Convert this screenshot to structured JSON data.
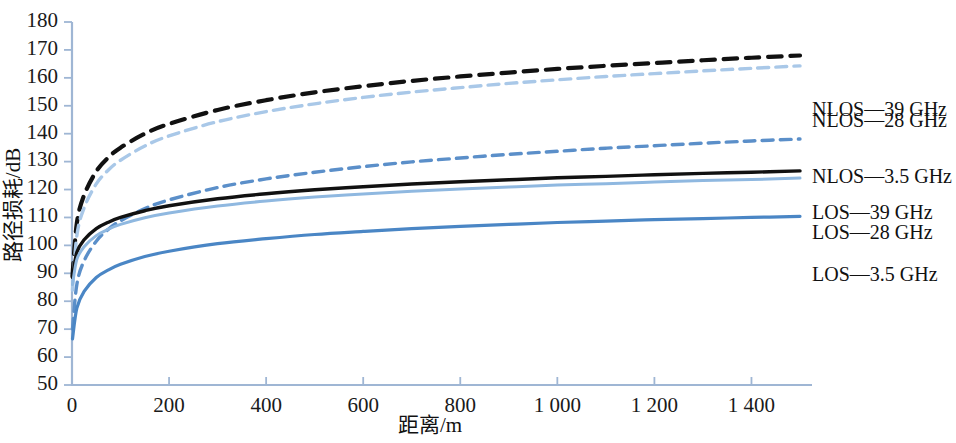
{
  "chart_data": {
    "type": "line",
    "title": "",
    "xlabel": "距离/m",
    "ylabel": "路径损耗/dB",
    "xlim": [
      0,
      1500
    ],
    "ylim": [
      50,
      180
    ],
    "xticks": [
      "0",
      "200",
      "400",
      "600",
      "800",
      "1 000",
      "1 200",
      "1 400"
    ],
    "xtick_values": [
      0,
      200,
      400,
      600,
      800,
      1000,
      1200,
      1400
    ],
    "yticks": [
      "50",
      "60",
      "70",
      "80",
      "90",
      "100",
      "110",
      "120",
      "130",
      "140",
      "150",
      "160",
      "170",
      "180"
    ],
    "ytick_values": [
      50,
      60,
      70,
      80,
      90,
      100,
      110,
      120,
      130,
      140,
      150,
      160,
      170,
      180
    ],
    "grid": false,
    "legend_position": "right-inline",
    "x": [
      1,
      10,
      25,
      50,
      75,
      100,
      150,
      200,
      300,
      400,
      500,
      600,
      700,
      800,
      900,
      1000,
      1100,
      1200,
      1300,
      1400,
      1500
    ],
    "series": [
      {
        "name": "NLOS—39 GHz",
        "label": "NLOS—39 GHz",
        "color": "#111111",
        "style": "dashed",
        "width": 4.2,
        "label_y": 148,
        "values": [
          89.0,
          108.0,
          118.0,
          126.5,
          131.5,
          135.0,
          140.0,
          143.5,
          148.5,
          152.0,
          154.8,
          157.0,
          158.9,
          160.5,
          161.9,
          163.2,
          164.3,
          165.3,
          166.3,
          167.2,
          168.0
        ]
      },
      {
        "name": "NLOS—28 GHz",
        "label": "NLOS—28 GHz",
        "color": "#a9c8e8",
        "style": "dashed",
        "width": 3.4,
        "label_y": 144,
        "values": [
          84.0,
          103.5,
          113.5,
          122.0,
          127.0,
          130.5,
          135.6,
          139.2,
          144.3,
          147.9,
          150.7,
          153.0,
          154.9,
          156.5,
          158.0,
          159.3,
          160.5,
          161.5,
          162.5,
          163.4,
          164.3
        ]
      },
      {
        "name": "NLOS—3.5 GHz",
        "label": "NLOS—3.5 GHz",
        "color": "#5b8fc9",
        "style": "dashed",
        "width": 3.4,
        "label_y": 124,
        "values": [
          70.0,
          86.0,
          94.5,
          101.5,
          105.8,
          108.8,
          113.2,
          116.3,
          120.7,
          123.8,
          126.2,
          128.2,
          129.9,
          131.3,
          132.6,
          133.7,
          134.8,
          135.7,
          136.6,
          137.4,
          138.1
        ]
      },
      {
        "name": "LOS—39 GHz",
        "label": "LOS—39 GHz",
        "color": "#111111",
        "style": "solid",
        "width": 3.4,
        "label_y": 111,
        "values": [
          88.5,
          97.5,
          102.0,
          106.0,
          108.3,
          110.0,
          112.4,
          114.2,
          116.7,
          118.5,
          119.9,
          121.0,
          122.0,
          122.8,
          123.5,
          124.2,
          124.7,
          125.3,
          125.8,
          126.2,
          126.7
        ]
      },
      {
        "name": "LOS—28 GHz",
        "label": "LOS—28 GHz",
        "color": "#8fb8e0",
        "style": "solid",
        "width": 3.0,
        "label_y": 104,
        "values": [
          86.0,
          95.0,
          99.5,
          103.5,
          105.8,
          107.5,
          109.9,
          111.6,
          114.1,
          115.9,
          117.3,
          118.4,
          119.4,
          120.2,
          120.9,
          121.6,
          122.1,
          122.7,
          123.2,
          123.6,
          124.1
        ]
      },
      {
        "name": "LOS—3.5 GHz",
        "label": "LOS—3.5 GHz",
        "color": "#4a86c5",
        "style": "solid",
        "width": 3.2,
        "label_y": 89,
        "values": [
          66.5,
          77.5,
          83.5,
          88.5,
          91.2,
          93.2,
          96.0,
          97.9,
          100.6,
          102.4,
          103.9,
          105.0,
          106.0,
          106.8,
          107.5,
          108.2,
          108.7,
          109.2,
          109.6,
          110.0,
          110.4
        ]
      }
    ]
  }
}
